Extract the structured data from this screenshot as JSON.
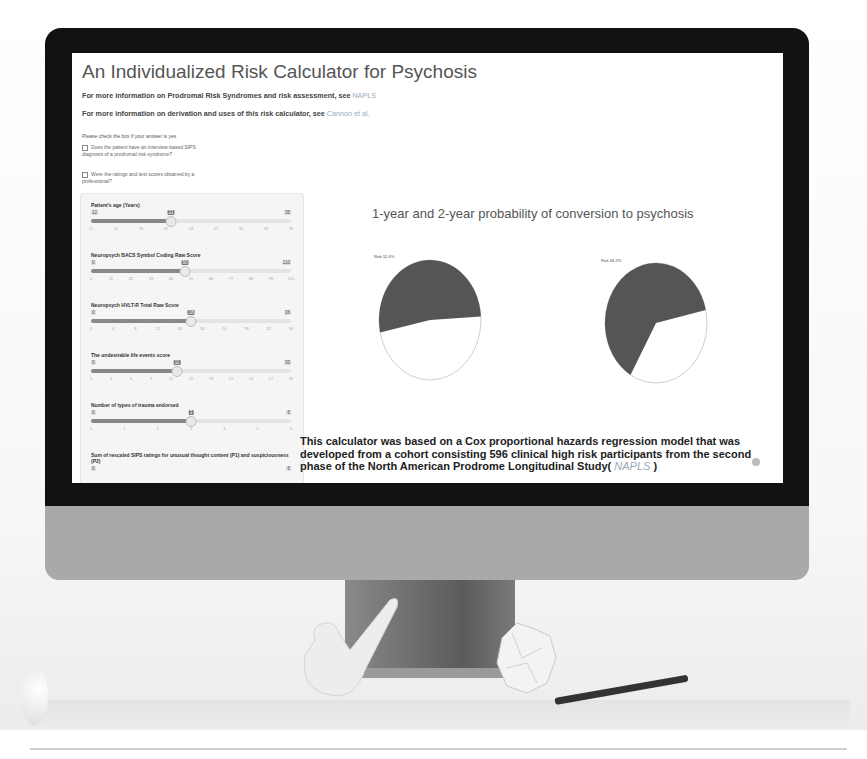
{
  "app": {
    "title": "An Individualized Risk Calculator for Psychosis",
    "info_lines": [
      {
        "text": "For more information on Prodromal Risk Syndromes and risk assessment, see ",
        "link": "NAPLS"
      },
      {
        "text": "For more information on derivation and uses of this risk calculator, see ",
        "link": "Cannon et al."
      }
    ],
    "hint": "Please check the box if your answer is yes",
    "checkboxes": [
      {
        "label": "Does the patient have an interview-based SIPS diagnosis of a prodromal risk syndrome?",
        "checked": false
      },
      {
        "label": "Were the ratings and test scores obtained by a professional?",
        "checked": false
      }
    ]
  },
  "sliders": [
    {
      "label": "Patient's age (Years)",
      "min": "12",
      "max": "35",
      "value": "21",
      "pct": 40,
      "ticks": [
        "12",
        "15",
        "18",
        "21",
        "24",
        "27",
        "30",
        "33",
        "35"
      ]
    },
    {
      "label": "Neuropsych BACS Symbol Coding Raw Score",
      "min": "0",
      "max": "110",
      "value": "50",
      "pct": 47,
      "ticks": [
        "0",
        "11",
        "22",
        "33",
        "44",
        "55",
        "66",
        "77",
        "88",
        "99",
        "110"
      ]
    },
    {
      "label": "Neuropsych HVLT-R Total Raw Score",
      "min": "0",
      "max": "36",
      "value": "18",
      "pct": 50,
      "ticks": [
        "0",
        "4",
        "8",
        "12",
        "16",
        "20",
        "24",
        "28",
        "32",
        "36"
      ]
    },
    {
      "label": "The undesirable life events score",
      "min": "0",
      "max": "30",
      "value": "11",
      "pct": 43,
      "ticks": [
        "0",
        "3",
        "6",
        "9",
        "12",
        "15",
        "18",
        "21",
        "24",
        "27",
        "30"
      ]
    },
    {
      "label": "Number of types of trauma endorsed",
      "min": "0",
      "max": "6",
      "value": "3",
      "pct": 50,
      "ticks": [
        "0",
        "1",
        "2",
        "3",
        "4",
        "5",
        "6"
      ]
    },
    {
      "label": "Sum of rescaled SIPS ratings for unusual thought content (P1) and suspiciousness (P2)",
      "min": "0",
      "max": "6",
      "value": "",
      "pct": 73,
      "ticks": []
    }
  ],
  "chart_data": {
    "type": "pie",
    "title": "1-year and 2-year probability of conversion to psychosis",
    "series": [
      {
        "name": "1-year",
        "label": "Risk 52.4%",
        "values": [
          52.4,
          47.6
        ],
        "categories": [
          "Risk",
          "No risk"
        ]
      },
      {
        "name": "2-year",
        "label": "Risk 63.2%",
        "values": [
          63.2,
          36.8
        ],
        "categories": [
          "Risk",
          "No risk"
        ]
      }
    ],
    "colors": {
      "risk": "#555555",
      "no_risk": "#ffffff"
    }
  },
  "description": {
    "text": "This calculator was based on a Cox proportional hazards regression model that was developed from a cohort consisting 596 clinical high risk participants from the second phase of the North American Prodrome Longitudinal Study( ",
    "link": "NAPLS",
    "suffix": " )"
  }
}
